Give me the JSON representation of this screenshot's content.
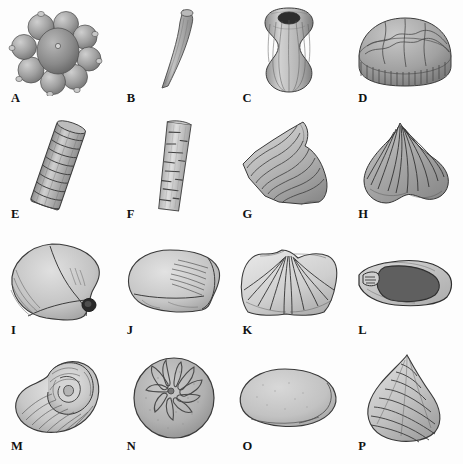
{
  "plate": {
    "title": "Fossil specimen plate",
    "description": "Grayscale scientific illustrations of sixteen invertebrate fossil specimens arranged in a four by four grid, each labelled with a bold serif capital letter at its lower left.",
    "background_color": "#fdfdfd",
    "ink_color": "#111111",
    "columns": 4,
    "rows": 4,
    "caption": ""
  },
  "specimens": [
    {
      "label": "A",
      "name": "sphere-cluster-coral",
      "shape": "cluster of rounded globular corallites",
      "row": 0,
      "col": 0
    },
    {
      "label": "B",
      "name": "curved-tapering-tube",
      "shape": "slender curved tapering tube",
      "row": 0,
      "col": 1
    },
    {
      "label": "C",
      "name": "vase-shaped-calyx",
      "shape": "ribbed vase-shaped calyx with crown",
      "row": 0,
      "col": 2
    },
    {
      "label": "D",
      "name": "domed-plated-test",
      "shape": "low dome with polygonal plates and fringe",
      "row": 0,
      "col": 3
    },
    {
      "label": "E",
      "name": "ringed-columnal-stem",
      "shape": "tilted ringed cylindrical stem",
      "row": 1,
      "col": 0
    },
    {
      "label": "F",
      "name": "striate-cylindrical-stem",
      "shape": "slim striated cylindrical stem",
      "row": 1,
      "col": 1
    },
    {
      "label": "G",
      "name": "horn-shaped-ridged-shell",
      "shape": "triangular shell with concentric ridges",
      "row": 1,
      "col": 2
    },
    {
      "label": "H",
      "name": "fan-ribbed-brachiopod",
      "shape": "fan-shaped shell with radiating ribs",
      "row": 1,
      "col": 3
    },
    {
      "label": "I",
      "name": "rounded-bivalve-valve",
      "shape": "rounded bivalve with hinge and umbo",
      "row": 2,
      "col": 0
    },
    {
      "label": "J",
      "name": "oval-ribbed-bivalve",
      "shape": "oval bivalve with oblique ribbing",
      "row": 2,
      "col": 1
    },
    {
      "label": "K",
      "name": "winged-radial-brachiopod",
      "shape": "broad winged shell with radial plications",
      "row": 2,
      "col": 2
    },
    {
      "label": "L",
      "name": "sectioned-wedge-shell",
      "shape": "wedge shell in section with dark infill",
      "row": 2,
      "col": 3
    },
    {
      "label": "M",
      "name": "coiled-gastropod",
      "shape": "coiled spiral gastropod shell",
      "row": 3,
      "col": 0
    },
    {
      "label": "N",
      "name": "petalled-echinoid-test",
      "shape": "globular echinoid test with petaloid ambulacra",
      "row": 3,
      "col": 1
    },
    {
      "label": "O",
      "name": "smooth-oval-valve",
      "shape": "smooth featureless oval valve",
      "row": 3,
      "col": 2
    },
    {
      "label": "P",
      "name": "conical-ridged-shell",
      "shape": "high-spired conical shell with growth ridges",
      "row": 3,
      "col": 3
    }
  ]
}
